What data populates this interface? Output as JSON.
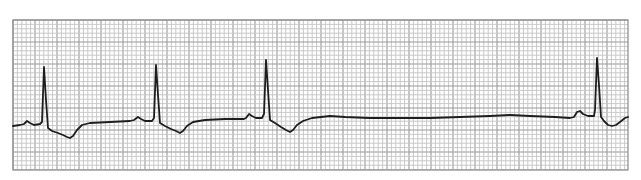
{
  "chart_data": {
    "type": "line",
    "title": "",
    "subtitle": "",
    "xlabel": "",
    "ylabel": "",
    "grid": true,
    "legend": null,
    "colors": {
      "background": "#ffffff",
      "grid_minor": "#c4c4c4",
      "grid_major": "#9a9a9a",
      "border": "#8a8a8a",
      "trace": "#1e1e1e"
    },
    "frame": {
      "x": 13,
      "y": 20,
      "width": 615,
      "height": 150
    },
    "grid_spacing_px": 4.4,
    "grid_major_every": 5,
    "beats": [
      {
        "label": "beat-1",
        "p_wave_x": 27,
        "r_peak_x": 44,
        "r_peak_y": 67,
        "t_wave_trough_x": 70,
        "t_wave_trough_y": 138
      },
      {
        "label": "beat-2",
        "p_wave_x": 138,
        "r_peak_x": 156,
        "r_peak_y": 65,
        "t_wave_trough_x": 180,
        "t_wave_trough_y": 133
      },
      {
        "label": "beat-3",
        "p_wave_x": 248,
        "r_peak_x": 266,
        "r_peak_y": 60,
        "t_wave_trough_x": 290,
        "t_wave_trough_y": 132
      },
      {
        "label": "beat-4",
        "p_wave_x": 578,
        "r_peak_x": 597,
        "r_peak_y": 58,
        "t_wave_trough_x": 612,
        "t_wave_trough_y": 126
      }
    ],
    "pause": {
      "start_x": 310,
      "end_x": 570
    },
    "trace_points": [
      [
        13,
        126
      ],
      [
        20,
        125
      ],
      [
        24,
        124
      ],
      [
        27,
        121
      ],
      [
        30,
        123
      ],
      [
        34,
        125
      ],
      [
        40,
        124
      ],
      [
        42,
        122
      ],
      [
        44,
        67
      ],
      [
        46,
        100
      ],
      [
        48,
        128
      ],
      [
        52,
        131
      ],
      [
        58,
        133
      ],
      [
        63,
        135
      ],
      [
        67,
        137
      ],
      [
        70,
        138
      ],
      [
        73,
        136
      ],
      [
        77,
        130
      ],
      [
        82,
        125
      ],
      [
        90,
        123
      ],
      [
        110,
        122
      ],
      [
        130,
        121
      ],
      [
        134,
        120
      ],
      [
        138,
        117
      ],
      [
        141,
        119
      ],
      [
        145,
        121
      ],
      [
        152,
        121
      ],
      [
        154,
        118
      ],
      [
        156,
        65
      ],
      [
        158,
        95
      ],
      [
        160,
        123
      ],
      [
        165,
        126
      ],
      [
        171,
        129
      ],
      [
        176,
        131
      ],
      [
        180,
        133
      ],
      [
        183,
        131
      ],
      [
        187,
        126
      ],
      [
        193,
        122
      ],
      [
        205,
        120
      ],
      [
        225,
        119
      ],
      [
        244,
        119
      ],
      [
        246,
        118
      ],
      [
        249,
        114
      ],
      [
        252,
        116
      ],
      [
        256,
        118
      ],
      [
        262,
        118
      ],
      [
        264,
        114
      ],
      [
        266,
        60
      ],
      [
        268,
        90
      ],
      [
        270,
        120
      ],
      [
        275,
        123
      ],
      [
        281,
        127
      ],
      [
        286,
        130
      ],
      [
        290,
        132
      ],
      [
        293,
        130
      ],
      [
        297,
        125
      ],
      [
        303,
        121
      ],
      [
        312,
        118
      ],
      [
        330,
        116
      ],
      [
        345,
        117
      ],
      [
        370,
        118
      ],
      [
        400,
        118
      ],
      [
        430,
        118
      ],
      [
        460,
        117
      ],
      [
        490,
        116
      ],
      [
        510,
        115
      ],
      [
        530,
        116
      ],
      [
        555,
        117
      ],
      [
        570,
        118
      ],
      [
        574,
        117
      ],
      [
        577,
        112
      ],
      [
        580,
        111
      ],
      [
        583,
        114
      ],
      [
        588,
        116
      ],
      [
        594,
        116
      ],
      [
        595,
        110
      ],
      [
        597,
        58
      ],
      [
        599,
        85
      ],
      [
        601,
        117
      ],
      [
        604,
        121
      ],
      [
        608,
        125
      ],
      [
        612,
        126
      ],
      [
        616,
        125
      ],
      [
        620,
        122
      ],
      [
        625,
        118
      ],
      [
        628,
        117
      ]
    ]
  }
}
